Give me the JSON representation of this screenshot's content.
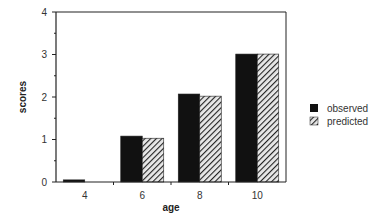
{
  "chart_data": {
    "type": "bar",
    "title": "",
    "xlabel": "age",
    "ylabel": "scores",
    "categories": [
      "4",
      "6",
      "8",
      "10"
    ],
    "series": [
      {
        "name": "observed",
        "values": [
          0.05,
          1.08,
          2.07,
          3.01
        ],
        "fill": "solid",
        "color": "#111111"
      },
      {
        "name": "predicted",
        "values": [
          0.0,
          1.03,
          2.02,
          3.01
        ],
        "fill": "hatched",
        "color": "#333333"
      }
    ],
    "yticks": [
      "0",
      "1",
      "2",
      "3",
      "4"
    ],
    "ylim": [
      0,
      4
    ],
    "grid": false,
    "legend_position": "right"
  },
  "legend": {
    "items": [
      {
        "label": "observed"
      },
      {
        "label": "predicted"
      }
    ]
  },
  "axes": {
    "x_title": "age",
    "y_title": "scores"
  }
}
